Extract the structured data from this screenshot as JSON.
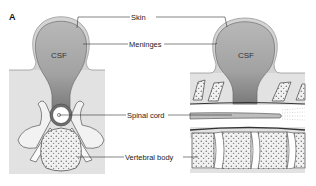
{
  "figure": {
    "panel_label": "A",
    "labels": {
      "skin": "Skin",
      "meninges": "Meninges",
      "spinal_cord": "Spinal cord",
      "vertebral_body": "Vertebral body"
    },
    "left_view": {
      "csf_label": "CSF",
      "orientation": "cross-section"
    },
    "right_view": {
      "csf_label": "CSF",
      "orientation": "sagittal"
    }
  },
  "colors": {
    "background_tissue": "#e2e2e2",
    "csf_sac": "#a9a9a9",
    "csf_sac_dark": "#7d7d7d",
    "skin_outline": "#cfcfcf",
    "bone": "#efefef",
    "line": "#333333"
  }
}
